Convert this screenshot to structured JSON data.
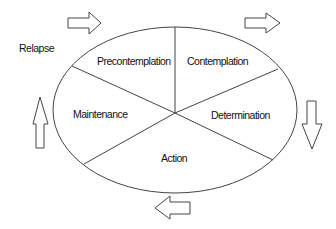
{
  "diagram": {
    "stages": [
      {
        "id": "precontemplation",
        "label": "Precontemplation"
      },
      {
        "id": "contemplation",
        "label": "Contemplation"
      },
      {
        "id": "determination",
        "label": "Determination"
      },
      {
        "id": "action",
        "label": "Action"
      },
      {
        "id": "maintenance",
        "label": "Maintenance"
      }
    ],
    "outside_label": "Relapse",
    "arrows": [
      {
        "position": "top-left",
        "direction": "right"
      },
      {
        "position": "top-right",
        "direction": "right"
      },
      {
        "position": "right",
        "direction": "down"
      },
      {
        "position": "bottom",
        "direction": "left"
      },
      {
        "position": "left",
        "direction": "up"
      }
    ],
    "colors": {
      "stroke": "#444444",
      "text": "#111111",
      "background": "#ffffff"
    }
  }
}
